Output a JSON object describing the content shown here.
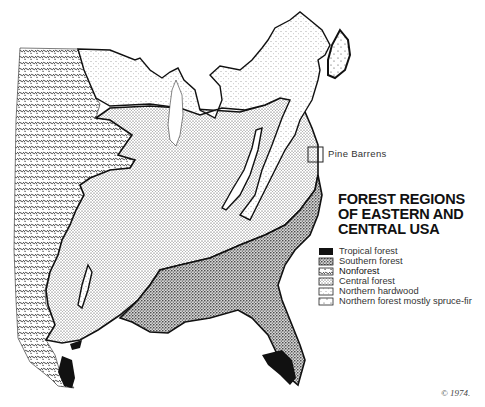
{
  "map": {
    "title_lines": [
      "FOREST REGIONS",
      "OF EASTERN AND",
      "CENTRAL USA"
    ],
    "callout": {
      "label": "Pine Barrens"
    },
    "legend": [
      {
        "label": "Tropical forest",
        "pattern": "solid-black"
      },
      {
        "label": "Southern forest",
        "pattern": "dense-dots"
      },
      {
        "label": "Nonforest",
        "pattern": "wavy-hatch"
      },
      {
        "label": "Central forest",
        "pattern": "fine-dots"
      },
      {
        "label": "Northern hardwood",
        "pattern": "sparse-dots"
      },
      {
        "label": "Northern forest mostly spruce-fir",
        "pattern": "plus-dots"
      }
    ],
    "copyright": "© 1974."
  },
  "colors": {
    "ink": "#111111",
    "paper": "#ffffff"
  }
}
